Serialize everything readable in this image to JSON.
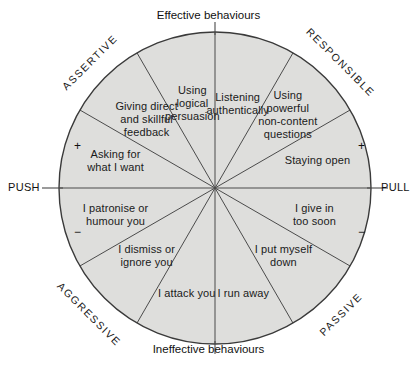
{
  "diagram": {
    "title_top": "Effective behaviours",
    "title_bottom": "Ineffective behaviours",
    "axis_left": "PUSH",
    "axis_right": "PULL",
    "sign_top_left": "+",
    "sign_top_right": "+",
    "sign_bottom_left": "−",
    "sign_bottom_right": "−",
    "colors": {
      "sector_fill": "#dededc",
      "line": "#4a4a4a",
      "outline": "#3a3a3a",
      "text": "#1a1a1a",
      "background": "#ffffff"
    },
    "quadrants": [
      {
        "label": "ASSERTIVE",
        "rotation_deg": -45,
        "position": "upper-left"
      },
      {
        "label": "RESPONSIBLE",
        "rotation_deg": 45,
        "position": "upper-right"
      },
      {
        "label": "AGGRESSIVE",
        "rotation_deg": 45,
        "position": "lower-left"
      },
      {
        "label": "PASSIVE",
        "rotation_deg": -45,
        "position": "lower-right"
      }
    ],
    "geometry": {
      "center_x": 215,
      "center_y": 188,
      "radius": 156,
      "sector_count": 12,
      "sector_span_deg": 30
    },
    "sectors": [
      {
        "index": 0,
        "label": "Listening\nauthentically",
        "quadrant": "RESPONSIBLE",
        "start_deg": 0,
        "end_deg": 30
      },
      {
        "index": 1,
        "label": "Using\npowerful\nnon-content\nquestions",
        "quadrant": "RESPONSIBLE",
        "start_deg": 30,
        "end_deg": 60
      },
      {
        "index": 2,
        "label": "Staying open",
        "quadrant": "RESPONSIBLE",
        "start_deg": 60,
        "end_deg": 90
      },
      {
        "index": 3,
        "label": "I give in\ntoo soon",
        "quadrant": "PASSIVE",
        "start_deg": 90,
        "end_deg": 120
      },
      {
        "index": 4,
        "label": "I put myself\ndown",
        "quadrant": "PASSIVE",
        "start_deg": 120,
        "end_deg": 150
      },
      {
        "index": 5,
        "label": "I run away",
        "quadrant": "PASSIVE",
        "start_deg": 150,
        "end_deg": 180
      },
      {
        "index": 6,
        "label": "I attack you",
        "quadrant": "AGGRESSIVE",
        "start_deg": 180,
        "end_deg": 210
      },
      {
        "index": 7,
        "label": "I dismiss or\nignore you",
        "quadrant": "AGGRESSIVE",
        "start_deg": 210,
        "end_deg": 240
      },
      {
        "index": 8,
        "label": "I patronise or\nhumour you",
        "quadrant": "AGGRESSIVE",
        "start_deg": 240,
        "end_deg": 270
      },
      {
        "index": 9,
        "label": "Asking for\nwhat I want",
        "quadrant": "ASSERTIVE",
        "start_deg": 270,
        "end_deg": 300
      },
      {
        "index": 10,
        "label": "Giving direct\nand skillful\nfeedback",
        "quadrant": "ASSERTIVE",
        "start_deg": 300,
        "end_deg": 330
      },
      {
        "index": 11,
        "label": "Using\nlogical\npersuasion",
        "quadrant": "ASSERTIVE",
        "start_deg": 330,
        "end_deg": 360
      }
    ]
  }
}
